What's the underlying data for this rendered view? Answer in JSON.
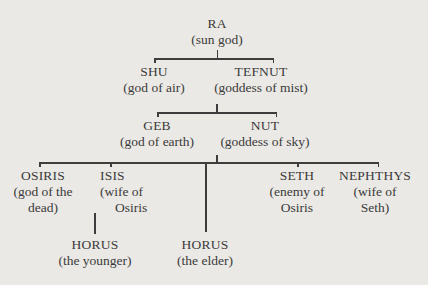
{
  "diagram": {
    "type": "family-tree",
    "nodes": {
      "ra": {
        "name": "RA",
        "desc": [
          "(sun god)"
        ]
      },
      "shu": {
        "name": "SHU",
        "desc": [
          "(god of air)"
        ]
      },
      "tefnut": {
        "name": "TEFNUT",
        "desc": [
          "(goddess of mist)"
        ]
      },
      "geb": {
        "name": "GEB",
        "desc": [
          "(god of earth)"
        ]
      },
      "nut": {
        "name": "NUT",
        "desc": [
          "(goddess of sky)"
        ]
      },
      "osiris": {
        "name": "OSIRIS",
        "desc": [
          "(god of the",
          "dead)"
        ]
      },
      "isis": {
        "name": "ISIS",
        "desc": [
          "(wife of",
          "Osiris"
        ]
      },
      "seth": {
        "name": "SETH",
        "desc": [
          "(enemy of",
          "Osiris"
        ]
      },
      "nephthys": {
        "name": "NEPHTHYS",
        "desc": [
          "(wife of",
          "Seth)"
        ]
      },
      "horus_younger": {
        "name": "HORUS",
        "desc": [
          "(the younger)"
        ]
      },
      "horus_elder": {
        "name": "HORUS",
        "desc": [
          "(the elder)"
        ]
      }
    },
    "relationships": [
      {
        "parent": "ra",
        "children": [
          "shu",
          "tefnut"
        ]
      },
      {
        "parents": [
          "shu",
          "tefnut"
        ],
        "children": [
          "geb",
          "nut"
        ]
      },
      {
        "parents": [
          "geb",
          "nut"
        ],
        "children": [
          "osiris",
          "isis",
          "horus_elder",
          "seth",
          "nephthys"
        ]
      },
      {
        "parents": [
          "osiris",
          "isis"
        ],
        "children": [
          "horus_younger"
        ]
      }
    ],
    "colors": {
      "background": "#ebe9e5",
      "text": "#3a3a3a",
      "lines": "#3d3d3d"
    }
  }
}
